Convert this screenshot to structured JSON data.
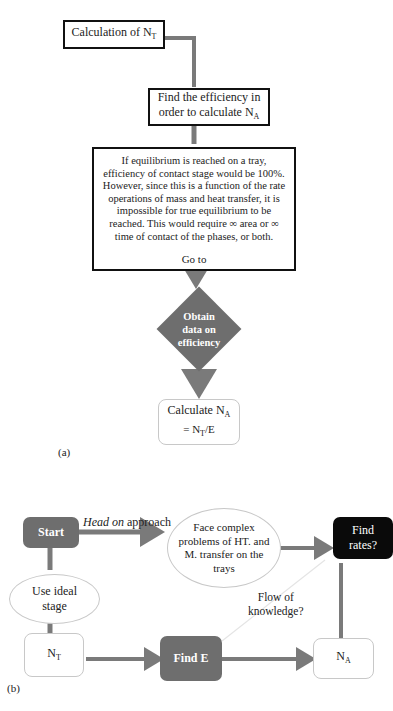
{
  "part_a": {
    "label": "(a)",
    "calc_nt": {
      "text": "Calculation of N",
      "sub": "T"
    },
    "find_eff": {
      "line1": "Find the efficiency in",
      "line2": "order to calculate N",
      "sub": "A"
    },
    "equilibrium_text": "If equilibrium is reached on a tray, efficiency of contact stage would be 100%. However, since this is a function of the rate operations of mass and heat transfer, it is impossible for true equilibrium to be reached. This would require ∞ area or ∞ time of contact of the phases, or both.",
    "go_to": "Go to",
    "diamond": {
      "line1": "Obtain",
      "line2": "data on",
      "line3": "efficiency"
    },
    "calc_na": {
      "line1": "Calculate N",
      "sub1": "A",
      "line2a": "= N",
      "sub2": "T",
      "line2b": "/E"
    }
  },
  "part_b": {
    "label": "(b)",
    "start": "Start",
    "head_on": {
      "italic": "Head on",
      "rest": " approach"
    },
    "face_complex": "Face complex problems of HT. and M. transfer on the trays",
    "find_rates": {
      "line1": "Find",
      "line2": "rates?"
    },
    "use_ideal": {
      "line1": "Use ideal",
      "line2": "stage"
    },
    "flow_knowledge": {
      "line1": "Flow of",
      "line2": "knowledge?"
    },
    "nt": {
      "text": "N",
      "sub": "T"
    },
    "find_e": "Find E",
    "na": {
      "text": "N",
      "sub": "A"
    }
  },
  "colors": {
    "arrow": "#7a7a7a",
    "dark_box": "#6e6e6e",
    "black_box": "#0a0a0a",
    "light_border": "#c8c8c8"
  }
}
